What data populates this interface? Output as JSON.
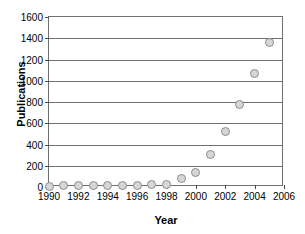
{
  "chart_data": {
    "type": "scatter",
    "title": "",
    "xlabel": "Year",
    "ylabel": "Publications",
    "x": [
      1990,
      1991,
      1992,
      1993,
      1994,
      1995,
      1996,
      1997,
      1998,
      1999,
      2000,
      2001,
      2002,
      2003,
      2004,
      2005
    ],
    "values": [
      5,
      10,
      12,
      12,
      10,
      14,
      14,
      20,
      22,
      80,
      140,
      310,
      520,
      775,
      1065,
      1360
    ],
    "series": [
      {
        "name": "Publications",
        "values": [
          5,
          10,
          12,
          12,
          10,
          14,
          14,
          20,
          22,
          80,
          140,
          310,
          520,
          775,
          1065,
          1360
        ]
      }
    ],
    "xlim": [
      1990,
      2006
    ],
    "ylim": [
      0,
      1600
    ],
    "xticks": [
      1990,
      1992,
      1994,
      1996,
      1998,
      2000,
      2002,
      2004,
      2006
    ],
    "xtick_labels": [
      "1990",
      "1992",
      "1994",
      "1996",
      "1998",
      "2000",
      "2002",
      "2004",
      "2006"
    ],
    "yticks": [
      0,
      200,
      400,
      600,
      800,
      1000,
      1200,
      1400,
      1600
    ],
    "ytick_labels": [
      "0",
      "200",
      "400",
      "600",
      "800",
      "1000",
      "1200",
      "1400",
      "1600"
    ],
    "grid": "horizontal",
    "legend": "none",
    "marker": {
      "shape": "circle",
      "fill_color": "#d6d6d6",
      "edge_color": "#8d8d8d"
    },
    "frame_color": "#6f6f6f",
    "background_color": "#ffffff"
  }
}
